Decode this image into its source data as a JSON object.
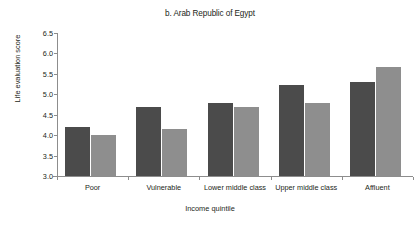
{
  "chart_data": {
    "type": "bar",
    "title": "b. Arab Republic of Egypt",
    "xlabel": "Income quintile",
    "ylabel": "Life evaluation score",
    "categories": [
      "Poor",
      "Vulnerable",
      "Lower middle class",
      "Upper middle class",
      "Affluent"
    ],
    "series": [
      {
        "name": "series-1-dark",
        "color": "#4b4b4b",
        "values": [
          4.19,
          4.68,
          4.78,
          5.22,
          5.3
        ]
      },
      {
        "name": "series-2-light",
        "color": "#8e8e8e",
        "values": [
          4.0,
          4.16,
          4.7,
          4.79,
          5.66
        ]
      }
    ],
    "ylim": [
      3.0,
      6.5
    ],
    "ytick_labels": [
      "3.0",
      "3.5",
      "4.0",
      "4.5",
      "5.0",
      "5.5",
      "6.0",
      "6.5"
    ],
    "ytick_values": [
      3.0,
      3.5,
      4.0,
      4.5,
      5.0,
      5.5,
      6.0,
      6.5
    ],
    "grid": false,
    "legend": "none"
  }
}
